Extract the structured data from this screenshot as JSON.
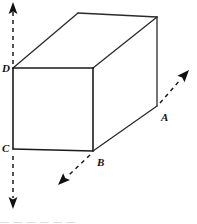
{
  "figure": {
    "type": "geometry-diagram",
    "stroke_color": "#1a1a1a",
    "background_color": "#ffffff",
    "vertices": [
      {
        "id": "A",
        "label": "A",
        "x": 157,
        "y": 106,
        "label_x": 161,
        "label_y": 121
      },
      {
        "id": "B",
        "label": "B",
        "x": 93,
        "y": 151,
        "label_x": 97,
        "label_y": 166
      },
      {
        "id": "C",
        "label": "C",
        "x": 13,
        "y": 149,
        "label_x": 2,
        "label_y": 152
      },
      {
        "id": "D",
        "label": "D",
        "x": 13,
        "y": 68,
        "label_x": 2,
        "label_y": 72
      }
    ],
    "box": {
      "front_face": "13,68 93,68 93,151 13,149",
      "top_face": "13,68 78,13 157,17 93,68",
      "right_face": "93,68 157,17 157,106 93,151"
    },
    "axes": [
      {
        "name": "up-axis-from-D",
        "from_x": 13,
        "from_y": 64,
        "to_x": 13,
        "to_y": 10,
        "arrow": "up"
      },
      {
        "name": "down-axis-from-C",
        "from_x": 13,
        "from_y": 155,
        "to_x": 13,
        "to_y": 200,
        "arrow": "down"
      },
      {
        "name": "upright-axis-from-A",
        "from_x": 160,
        "from_y": 103,
        "to_x": 182,
        "to_y": 78,
        "arrow": "up-right"
      },
      {
        "name": "downleft-axis-from-B",
        "from_x": 90,
        "from_y": 155,
        "to_x": 66,
        "to_y": 177,
        "arrow": "down-left"
      }
    ],
    "bottom_caption": "— — —   — — —"
  }
}
